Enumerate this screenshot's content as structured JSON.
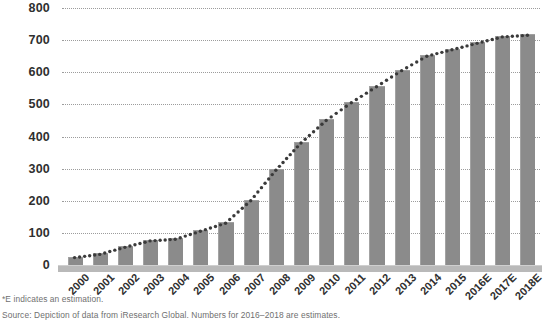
{
  "chart_data": {
    "type": "bar",
    "title": "",
    "subtitle": "",
    "xlabel": "",
    "ylabel": "",
    "ylim": [
      0,
      800
    ],
    "ytick_step": 100,
    "yticks": [
      "0",
      "100",
      "200",
      "300",
      "400",
      "500",
      "600",
      "700",
      "800"
    ],
    "grid": true,
    "legend": "none",
    "categories": [
      "2000",
      "2001",
      "2002",
      "2003",
      "2004",
      "2005",
      "2006",
      "2007",
      "2008",
      "2009",
      "2010",
      "2011",
      "2012",
      "2013",
      "2014",
      "2015",
      "2016E",
      "2017E",
      "2018E"
    ],
    "values": [
      23,
      33,
      55,
      75,
      80,
      105,
      130,
      200,
      295,
      380,
      450,
      505,
      555,
      605,
      650,
      670,
      690,
      710,
      715
    ],
    "series": [
      {
        "name": "bars",
        "style": "bar",
        "color": "#8b8b8b",
        "values": [
          23,
          33,
          55,
          75,
          80,
          105,
          130,
          200,
          295,
          380,
          450,
          505,
          555,
          605,
          650,
          670,
          690,
          710,
          715
        ]
      },
      {
        "name": "trend",
        "style": "dotted-line",
        "color": "#3a3a3a",
        "values": [
          23,
          33,
          55,
          75,
          80,
          105,
          130,
          200,
          295,
          380,
          450,
          505,
          555,
          605,
          650,
          670,
          690,
          710,
          715
        ]
      }
    ],
    "annotations": []
  },
  "footnotes": {
    "estimate_note": "*E indicates an estimation.",
    "source_note": "Source: Depiction of data from iResearch Global. Numbers for 2016–2018 are estimates."
  },
  "colors": {
    "bar_fill": "#8b8b8b",
    "bar_foot": "#6d6d6d",
    "baseline": "#b9b9b9",
    "gridline": "#9c9c9c",
    "trend_dot": "#3a3a3a",
    "axis_text": "#2f2f2f",
    "footnote_text": "#6f6f6f",
    "background": "#ffffff"
  }
}
